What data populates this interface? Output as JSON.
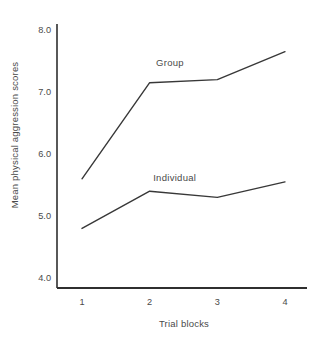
{
  "figure": {
    "background": "#ffffff",
    "line_color": "#383838",
    "axis_color": "#2f2f2f",
    "text_color": "#4a4a4a"
  },
  "chart_data": {
    "type": "line",
    "title": "",
    "xlabel": "Trial blocks",
    "ylabel": "Mean physical aggression scores",
    "categories": [
      1,
      2,
      3,
      4
    ],
    "xtick_labels": [
      "1",
      "2",
      "3",
      "4"
    ],
    "yticks": [
      8.0,
      7.0,
      6.0,
      5.0,
      4.0
    ],
    "ytick_labels": [
      "8.0",
      "7.0",
      "6.0",
      "5.0",
      "4.0"
    ],
    "ylim": [
      4.0,
      8.0
    ],
    "grid": false,
    "legend": "inline-labels",
    "series": [
      {
        "name": "Group",
        "values": [
          5.6,
          7.15,
          7.2,
          7.65
        ],
        "label_anchor": {
          "x": 2.3,
          "y": 7.47
        }
      },
      {
        "name": "Individual",
        "values": [
          4.8,
          5.4,
          5.3,
          5.55
        ],
        "label_anchor": {
          "x": 2.37,
          "y": 5.62
        }
      }
    ]
  }
}
